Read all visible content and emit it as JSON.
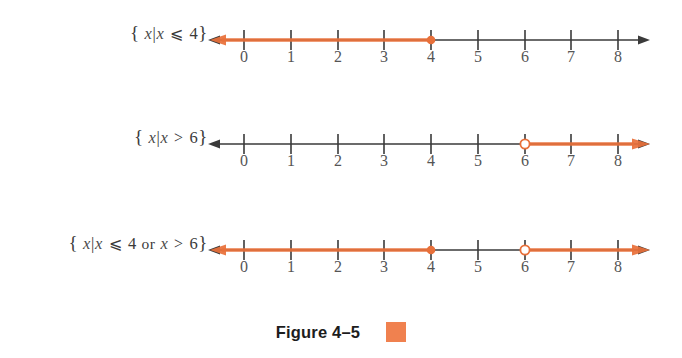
{
  "figure": {
    "caption": "Figure 4–5",
    "swatch_color": "#f0814f",
    "accent_color": "#e8703a",
    "axis_color": "#3a3a3a",
    "label_color": "#555555"
  },
  "axis": {
    "ticks": [
      "0",
      "1",
      "2",
      "3",
      "4",
      "5",
      "6",
      "7",
      "8"
    ],
    "min": 0,
    "max": 8,
    "left_arrow": true,
    "right_arrow": true
  },
  "lines": [
    {
      "name": "x-less-equal-4",
      "label": {
        "open_brace": "{",
        "set_var": "x",
        "bar": "|",
        "var": "x",
        "relation": "⩽",
        "value": "4",
        "close_brace": "}",
        "full": "{ x|x ⩽ 4 }"
      },
      "segments": [
        {
          "from": -1,
          "to": 4,
          "arrow": "left"
        }
      ],
      "points": [
        {
          "at": 4,
          "type": "closed"
        }
      ]
    },
    {
      "name": "x-greater-6",
      "label": {
        "open_brace": "{",
        "set_var": "x",
        "bar": "|",
        "var": "x",
        "relation": ">",
        "value": "6",
        "close_brace": "}",
        "full": "{ x|x > 6 }"
      },
      "segments": [
        {
          "from": 6,
          "to": 9,
          "arrow": "right"
        }
      ],
      "points": [
        {
          "at": 6,
          "type": "open"
        }
      ]
    },
    {
      "name": "x-less-equal-4-or-x-greater-6",
      "label": {
        "open_brace": "{",
        "set_var": "x",
        "bar": "|",
        "var": "x",
        "relation": "⩽",
        "value": "4",
        "conjunction": "or",
        "var2": "x",
        "relation2": ">",
        "value2": "6",
        "close_brace": "}",
        "full": "{ x|x ⩽ 4 or x > 6 }"
      },
      "segments": [
        {
          "from": -1,
          "to": 4,
          "arrow": "left"
        },
        {
          "from": 6,
          "to": 9,
          "arrow": "right"
        }
      ],
      "points": [
        {
          "at": 4,
          "type": "closed"
        },
        {
          "at": 6,
          "type": "open"
        }
      ]
    }
  ]
}
